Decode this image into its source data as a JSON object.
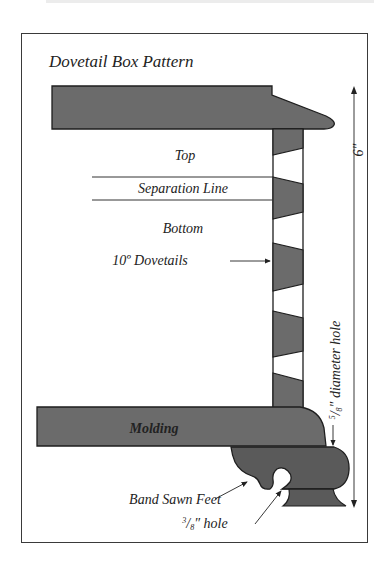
{
  "title": "Dovetail Box Pattern",
  "labels": {
    "top": "Top",
    "separation_line": "Separation Line",
    "bottom": "Bottom",
    "dovetails": "10º Dovetails",
    "molding": "Molding",
    "band_sawn_feet": "Band Sawn Feet",
    "hole_small_num": "3",
    "hole_small_den": "8",
    "hole_small_text": "″ hole",
    "hole_diameter_num": "5",
    "hole_diameter_den": "8",
    "hole_diameter_text": "″ diameter hole",
    "height_dimension": "6″"
  },
  "colors": {
    "wood_fill": "#6b6b6b",
    "wood_dark": "#5a5a5a",
    "outline": "#1e1e1e",
    "frame": "#3a3a3a"
  }
}
